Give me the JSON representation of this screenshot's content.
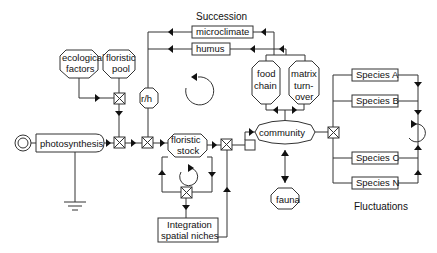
{
  "labels": {
    "succession": "Succession",
    "fluctuations": "Fluctuations",
    "microclimate": "microclimate",
    "humus": "humus",
    "ecological_1": "ecological",
    "ecological_2": "factors",
    "floristic_pool_1": "floristic",
    "floristic_pool_2": "pool",
    "rh": "r/h",
    "photosynthesis": "photosynthesis",
    "floristic_stock_1": "floristic",
    "floristic_stock_2": "stock",
    "food_chain_1": "food",
    "food_chain_2": "chain",
    "matrix_1": "matrix",
    "matrix_2": "turn-",
    "matrix_3": "over",
    "community": "community",
    "fauna": "fauna",
    "integration_1": "Integration",
    "integration_2": "spatial niches",
    "species_a": "Species A",
    "species_b": "Species B",
    "species_c": "Species C",
    "species_n": "Species N"
  },
  "colors": {
    "line": "#333333",
    "fill": "#ffffff",
    "text": "#111111"
  }
}
